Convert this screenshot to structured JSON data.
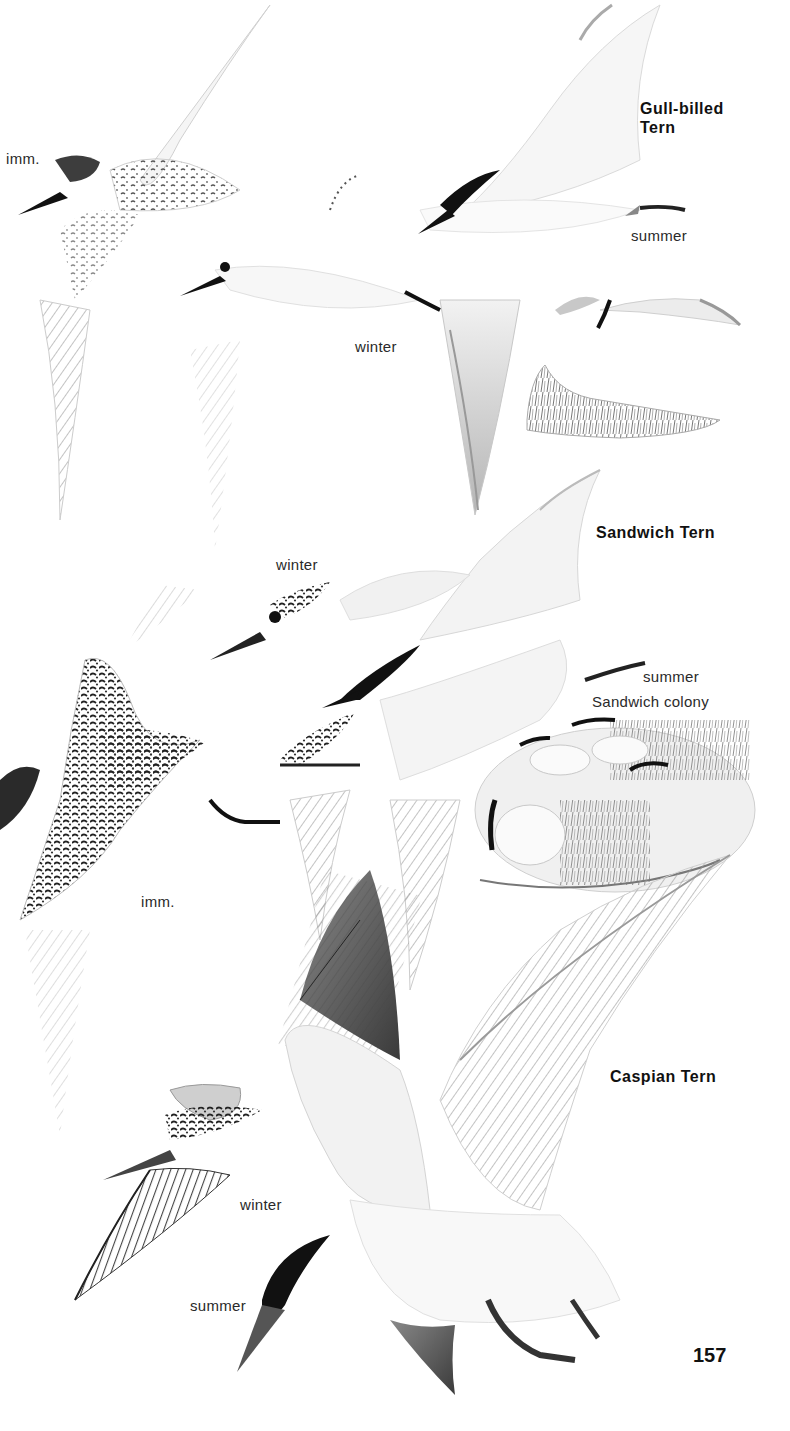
{
  "page": {
    "page_number": "157",
    "background": "#ffffff",
    "ink_color": "#1a1a1a"
  },
  "species": [
    {
      "name_line1": "Gull-billed",
      "name_line2": "Tern",
      "labels": {
        "immature": "imm.",
        "winter": "winter",
        "summer": "summer"
      }
    },
    {
      "name": "Sandwich Tern",
      "labels": {
        "winter": "winter",
        "summer": "summer",
        "immature": "imm.",
        "colony": "Sandwich colony"
      }
    },
    {
      "name": "Caspian Tern",
      "labels": {
        "winter": "winter",
        "summer": "summer"
      }
    }
  ],
  "illustrations": {
    "gull_billed_imm": "gull-billed-tern-immature-illustration",
    "gull_billed_winter": "gull-billed-tern-winter-illustration",
    "gull_billed_summer": "gull-billed-tern-summer-illustration",
    "sandwich_winter": "sandwich-tern-winter-illustration",
    "sandwich_summer": "sandwich-tern-summer-illustration",
    "sandwich_imm": "sandwich-tern-immature-illustration",
    "sandwich_colony": "sandwich-colony-illustration",
    "caspian_winter": "caspian-tern-winter-illustration",
    "caspian_summer": "caspian-tern-summer-illustration"
  }
}
